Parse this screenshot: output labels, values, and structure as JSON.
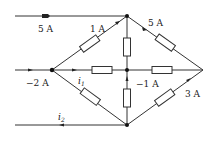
{
  "diagram": {
    "type": "circuit",
    "nodes": [
      "top",
      "left",
      "center",
      "right",
      "bottom"
    ],
    "labels": {
      "top_input": "5 A",
      "top_left_branch": "1 A",
      "top_right_branch": "5 A",
      "left_input": "−2 A",
      "i1": "i",
      "i1_sub": "1",
      "center_lower": "−1 A",
      "bottom_right_branch": "3 A",
      "i2": "i",
      "i2_sub": "2"
    }
  }
}
